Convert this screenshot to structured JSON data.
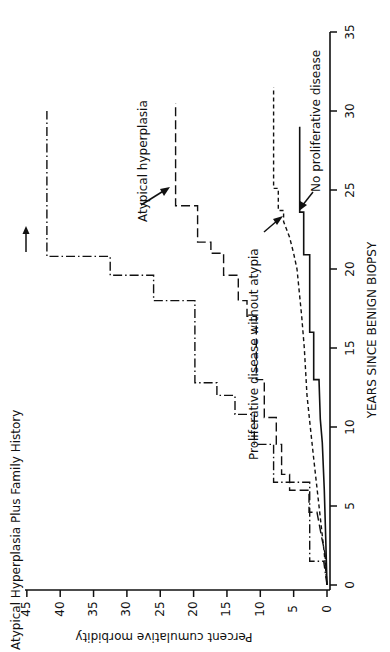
{
  "chart_data": {
    "type": "line",
    "subtype": "step",
    "orientation": "rotated-90-ccw",
    "title": "",
    "xlabel": "YEARS SINCE BENIGN BIOPSY",
    "ylabel": "Percent cumulative morbidity",
    "xlim": [
      0,
      35
    ],
    "ylim": [
      0,
      45
    ],
    "xticks": [
      0,
      5,
      10,
      15,
      20,
      25,
      30,
      35
    ],
    "yticks": [
      0,
      5,
      10,
      15,
      20,
      25,
      30,
      35,
      40,
      45
    ],
    "grid": false,
    "legend": "inline annotations with arrows",
    "series": [
      {
        "name": "Atypical Hyperplasia Plus Family History",
        "style": "dash-dot",
        "points": [
          [
            0,
            0
          ],
          [
            1.5,
            0.5
          ],
          [
            1.5,
            2.6
          ],
          [
            6.5,
            2.6
          ],
          [
            6.5,
            8.0
          ],
          [
            8.9,
            8.0
          ],
          [
            8.9,
            10.9
          ],
          [
            10.8,
            10.9
          ],
          [
            10.8,
            13.8
          ],
          [
            12.0,
            13.8
          ],
          [
            12.0,
            16.5
          ],
          [
            12.8,
            16.5
          ],
          [
            12.8,
            19.8
          ],
          [
            18.0,
            19.8
          ],
          [
            18.0,
            26.0
          ],
          [
            19.6,
            26.0
          ],
          [
            19.6,
            32.5
          ],
          [
            20.8,
            32.5
          ],
          [
            20.8,
            42.0
          ],
          [
            30.0,
            42.0
          ]
        ]
      },
      {
        "name": "Atypical hyperplasia",
        "style": "long-dash",
        "points": [
          [
            0,
            0
          ],
          [
            2.0,
            0.3
          ],
          [
            3.0,
            0.8
          ],
          [
            4.6,
            1.5
          ],
          [
            4.6,
            2.7
          ],
          [
            6.0,
            2.7
          ],
          [
            6.0,
            5.6
          ],
          [
            7.0,
            5.6
          ],
          [
            7.0,
            6.8
          ],
          [
            8.9,
            6.8
          ],
          [
            8.9,
            7.6
          ],
          [
            10.6,
            7.6
          ],
          [
            10.6,
            9.4
          ],
          [
            13.0,
            9.4
          ],
          [
            13.0,
            10.6
          ],
          [
            17.0,
            10.6
          ],
          [
            17.0,
            12.0
          ],
          [
            18.0,
            12.0
          ],
          [
            18.0,
            13.3
          ],
          [
            19.6,
            13.3
          ],
          [
            19.6,
            15.5
          ],
          [
            21.0,
            15.5
          ],
          [
            21.0,
            17.4
          ],
          [
            21.7,
            17.4
          ],
          [
            21.7,
            19.4
          ],
          [
            24.0,
            19.4
          ],
          [
            24.0,
            22.7
          ],
          [
            30.5,
            22.7
          ]
        ]
      },
      {
        "name": "Proliferative disease without atypia",
        "style": "short-dash",
        "points": [
          [
            0,
            0
          ],
          [
            2,
            0.4
          ],
          [
            5,
            1.2
          ],
          [
            8,
            2.0
          ],
          [
            10,
            2.5
          ],
          [
            12,
            3.0
          ],
          [
            15,
            3.4
          ],
          [
            17,
            3.8
          ],
          [
            20,
            4.5
          ],
          [
            21,
            5.0
          ],
          [
            22,
            5.6
          ],
          [
            23,
            6.5
          ],
          [
            23.7,
            6.5
          ],
          [
            23.7,
            7.3
          ],
          [
            25.1,
            7.3
          ],
          [
            25.1,
            8.0
          ],
          [
            31.5,
            8.0
          ]
        ]
      },
      {
        "name": "No proliferative disease",
        "style": "solid",
        "points": [
          [
            0,
            0
          ],
          [
            3,
            0.2
          ],
          [
            6,
            0.4
          ],
          [
            9,
            0.7
          ],
          [
            10.5,
            1.0
          ],
          [
            13,
            1.2
          ],
          [
            13,
            2.0
          ],
          [
            16,
            2.0
          ],
          [
            16,
            2.6
          ],
          [
            20.9,
            2.6
          ],
          [
            20.9,
            3.5
          ],
          [
            23.6,
            3.5
          ],
          [
            23.6,
            4.1
          ],
          [
            29.0,
            4.1
          ]
        ]
      }
    ],
    "annotations": [
      {
        "text": "Atypical Hyperplasia Plus Family History",
        "arrow": "toward dash-dot curve at ~42%"
      },
      {
        "text": "Atypical hyperplasia",
        "arrow": "toward long-dash curve near year 24"
      },
      {
        "text": "Proliferative disease without atypia",
        "arrow": "toward short-dash curve near year 24"
      },
      {
        "text": "No proliferative disease",
        "arrow": "toward solid curve near year 24"
      }
    ]
  },
  "labels": {
    "xlabel": "YEARS SINCE BENIGN BIOPSY",
    "ylabel": "Percent cumulative morbidity",
    "ann_afh": "Atypical Hyperplasia Plus Family History",
    "ann_ah": "Atypical hyperplasia",
    "ann_pd": "Proliferative disease without atypia",
    "ann_npd": "No proliferative disease"
  }
}
